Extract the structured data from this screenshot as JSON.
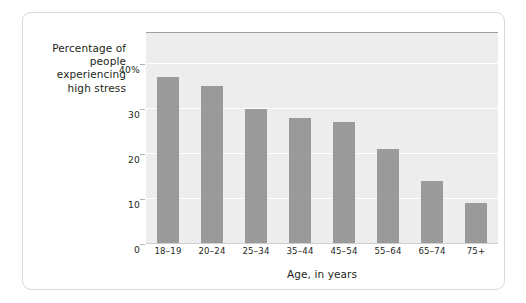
{
  "chart_data": {
    "type": "bar",
    "title": "",
    "subtitle": "",
    "xlabel": "Age, in years",
    "ylabel": "Percentage of people experiencing high stress",
    "ylabel_lines": [
      "Percentage of",
      "people",
      "experiencing",
      "high stress"
    ],
    "categories": [
      "18–19",
      "20–24",
      "25–34",
      "35–44",
      "45–54",
      "55–64",
      "65–74",
      "75+"
    ],
    "values": [
      37,
      35,
      30,
      28,
      27,
      21,
      14,
      9
    ],
    "ylim": [
      0,
      47
    ],
    "yticks": [
      0,
      10,
      20,
      30,
      40
    ],
    "ytick_labels": [
      "0",
      "10",
      "20",
      "30",
      "40%"
    ],
    "grid": "horizontal",
    "legend": "none",
    "colors": {
      "bar": "#9a9a9a",
      "plot_background": "#ededed",
      "gridline": "#ffffff",
      "frame_border": "#d9d9d9",
      "text": "#231f20",
      "plot_top_rule": "#9e9e9e"
    }
  }
}
